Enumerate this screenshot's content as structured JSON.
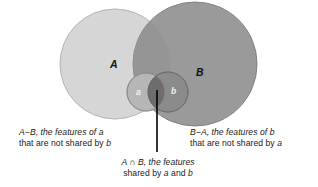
{
  "figure": {
    "colors": {
      "circle_a_fill": "#d6d6d6",
      "circle_a_stroke": "#b0b0b0",
      "circle_b_fill": "#9a9a9a",
      "circle_b_stroke": "#7d7d7d",
      "small_a_fill": "#b4b4b4",
      "small_b_fill": "#8a8a8a",
      "small_overlap_fill": "#6e6e6e",
      "pointer_line": "#000000",
      "background": "#ffffff",
      "text": "#1a1a1a",
      "sublabel_text": "#f2f2f2"
    },
    "labels": {
      "set_a": "A",
      "set_b": "B",
      "subset_a": "a",
      "subset_b": "b"
    },
    "captions": {
      "left": {
        "line1_prefix": "A",
        "line1_minus": "−",
        "line1_mid": "B, the features of ",
        "line1_italic": "a",
        "line2_prefix": "that are not shared by ",
        "line2_italic": "b",
        "full": "A−B, the features of a that are not shared by b"
      },
      "right": {
        "line1_prefix": "B",
        "line1_minus": "−",
        "line1_mid": "A, the features of ",
        "line1_italic": "b",
        "line2_prefix": "that are not shared by ",
        "line2_italic": "a",
        "full": "B−A, the features of b that are not shared by a"
      },
      "bottom": {
        "line1_prefix": "A ",
        "line1_symbol": "∩",
        "line1_mid": " B, the features",
        "line2_prefix": "shared by ",
        "line2_italic1": "a",
        "line2_mid": " and ",
        "line2_italic2": "b",
        "full": "A ∩ B, the features shared by a and b"
      }
    },
    "geometry": {
      "circle_a": {
        "cx": 115,
        "cy": 64,
        "r": 55
      },
      "circle_b": {
        "cx": 195,
        "cy": 64,
        "r": 62
      },
      "small_a": {
        "cx": 146,
        "cy": 92,
        "r": 19
      },
      "small_b": {
        "cx": 168,
        "cy": 92,
        "r": 20
      },
      "pointer": {
        "x": 157,
        "y_top": 90,
        "y_bottom": 152
      }
    }
  }
}
